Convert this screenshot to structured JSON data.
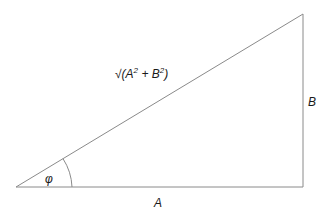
{
  "diagram": {
    "type": "right-triangle",
    "vertices": {
      "origin": [
        16,
        187
      ],
      "right_angle": [
        303,
        187
      ],
      "apex": [
        303,
        14
      ]
    },
    "labels": {
      "hypotenuse": "√(A² + B²)",
      "hyp_base": "√(A",
      "hyp_sup1": "2",
      "hyp_mid": " + B",
      "hyp_sup2": "2",
      "hyp_end": ")",
      "side_vertical": "B",
      "side_horizontal": "A",
      "angle": "φ"
    },
    "colors": {
      "line": "#8a8a8a",
      "text": "#1a1a1a",
      "background": "#ffffff"
    }
  }
}
